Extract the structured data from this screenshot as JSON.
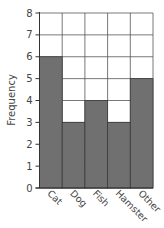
{
  "chart_data": {
    "type": "bar",
    "title": "",
    "xlabel": "",
    "ylabel": "Frequency",
    "categories": [
      "Cat",
      "Dog",
      "Fish",
      "Hamster",
      "Other"
    ],
    "values": [
      6,
      3,
      4,
      3,
      5
    ],
    "ylim": [
      0,
      8
    ],
    "yticks": [
      0,
      1,
      2,
      3,
      4,
      5,
      6,
      7,
      8
    ],
    "grid": true,
    "legend": null,
    "bar_color": "#707070",
    "grid_color": "#555555",
    "x_tick_rotation": 45
  }
}
